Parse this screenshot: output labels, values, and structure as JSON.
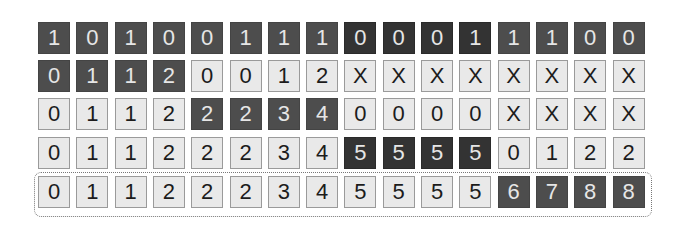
{
  "diagram": {
    "title": "",
    "rows": [
      {
        "cells": [
          "1",
          "0",
          "1",
          "0",
          "0",
          "1",
          "1",
          "1",
          "0",
          "0",
          "0",
          "1",
          "1",
          "1",
          "0",
          "0"
        ],
        "styles": [
          "dark",
          "dark",
          "dark",
          "dark",
          "dark",
          "dark",
          "dark",
          "dark",
          "darker",
          "darker",
          "darker",
          "darker",
          "dark",
          "dark",
          "dark",
          "dark"
        ]
      },
      {
        "cells": [
          "0",
          "1",
          "1",
          "2",
          "0",
          "0",
          "1",
          "2",
          "X",
          "X",
          "X",
          "X",
          "X",
          "X",
          "X",
          "X"
        ],
        "styles": [
          "dark",
          "dark",
          "dark",
          "dark",
          "light",
          "light",
          "light",
          "light",
          "light",
          "light",
          "light",
          "light",
          "light",
          "light",
          "light",
          "light"
        ]
      },
      {
        "cells": [
          "0",
          "1",
          "1",
          "2",
          "2",
          "2",
          "3",
          "4",
          "0",
          "0",
          "0",
          "0",
          "X",
          "X",
          "X",
          "X"
        ],
        "styles": [
          "light",
          "light",
          "light",
          "light",
          "dark",
          "dark",
          "dark",
          "dark",
          "light",
          "light",
          "light",
          "light",
          "light",
          "light",
          "light",
          "light"
        ]
      },
      {
        "cells": [
          "0",
          "1",
          "1",
          "2",
          "2",
          "2",
          "3",
          "4",
          "5",
          "5",
          "5",
          "5",
          "0",
          "1",
          "2",
          "2"
        ],
        "styles": [
          "light",
          "light",
          "light",
          "light",
          "light",
          "light",
          "light",
          "light",
          "darker",
          "darker",
          "darker",
          "darker",
          "light",
          "light",
          "light",
          "light"
        ]
      },
      {
        "cells": [
          "0",
          "1",
          "1",
          "2",
          "2",
          "2",
          "3",
          "4",
          "5",
          "5",
          "5",
          "5",
          "6",
          "7",
          "8",
          "8"
        ],
        "styles": [
          "light",
          "light",
          "light",
          "light",
          "light",
          "light",
          "light",
          "light",
          "light",
          "light",
          "light",
          "light",
          "dark",
          "dark",
          "dark",
          "dark"
        ]
      }
    ],
    "highlighted_row": 4
  }
}
